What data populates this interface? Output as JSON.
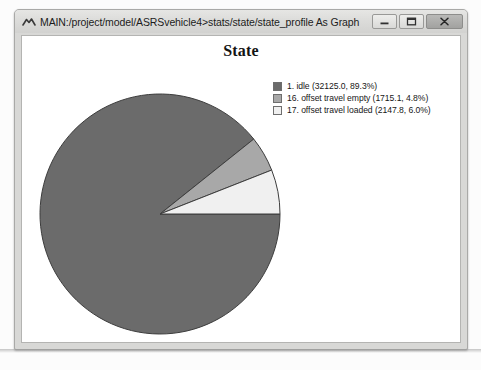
{
  "window": {
    "title": "MAIN:/project/model/ASRSvehicle4>stats/state/state_profile As Graph",
    "icon": "graph-icon",
    "controls": {
      "minimize_label": "Minimize",
      "maximize_label": "Maximize",
      "close_label": "Close"
    }
  },
  "chart_data": {
    "type": "pie",
    "title": "State",
    "xlabel": "",
    "ylabel": "",
    "legend_position": "right",
    "grid": false,
    "start_angle_deg": 0,
    "direction": "clockwise",
    "categories": [
      "1. idle",
      "16. offset travel empty",
      "17. offset travel loaded"
    ],
    "values": [
      32125.0,
      1715.1,
      2147.8
    ],
    "percents": [
      89.3,
      4.8,
      6.0
    ],
    "total": 35987.9,
    "colors": [
      "#6b6b6b",
      "#a8a8a8",
      "#f0f0f0"
    ],
    "legend_entries": [
      "1. idle (32125.0, 89.3%)",
      "16. offset travel empty (1715.1, 4.8%)",
      "17. offset travel loaded (2147.8, 6.0%)"
    ],
    "slices": [
      {
        "label": "1. idle",
        "value": 32125.0,
        "percent": 89.3,
        "color": "#6b6b6b"
      },
      {
        "label": "16. offset travel empty",
        "value": 1715.1,
        "percent": 4.8,
        "color": "#a8a8a8"
      },
      {
        "label": "17. offset travel loaded",
        "value": 2147.8,
        "percent": 6.0,
        "color": "#f0f0f0"
      }
    ]
  },
  "caption": {
    "text": ""
  }
}
